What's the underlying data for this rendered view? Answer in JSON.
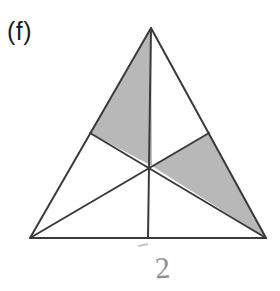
{
  "figure": {
    "part_label": "(f)",
    "hand_annotation": "2",
    "caption": "",
    "background_color": "#ffffff",
    "stroke_color": "#3a3a3a",
    "shade_color": "#b8b8b8",
    "annotation_color": "#8f8f8f",
    "label_color": "#1c1c1c",
    "stroke_width": "2",
    "geometry": {
      "type": "triangle-with-medians",
      "vertices": {
        "apex": [
          151,
          28
        ],
        "bottom_left": [
          30,
          238
        ],
        "bottom_right": [
          266,
          238
        ]
      },
      "midpoints": {
        "left_side": [
          90,
          133
        ],
        "right_side": [
          209,
          133
        ],
        "base": [
          148,
          238
        ]
      },
      "centroid": [
        152,
        166
      ],
      "medians": [
        {
          "name": "median-apex-to-base",
          "from": "apex",
          "to": "base_midpoint"
        },
        {
          "name": "median-bottom-left-to-right-side",
          "from": "bottom_left",
          "to": "right_side_midpoint"
        },
        {
          "name": "median-bottom-right-to-left-side",
          "from": "bottom_right",
          "to": "left_side_midpoint"
        }
      ],
      "shaded_regions": [
        {
          "name": "upper-left-shaded-triangle",
          "points": [
            [
              151,
              28
            ],
            [
              90,
              133
            ],
            [
              152,
              166
            ]
          ],
          "fill": "#b8b8b8"
        },
        {
          "name": "lower-right-shaded-triangle",
          "points": [
            [
              152,
              166
            ],
            [
              209,
              133
            ],
            [
              266,
              238
            ]
          ],
          "fill": "#b8b8b8"
        }
      ],
      "unshaded_region_count": 4,
      "total_region_count": 6
    }
  }
}
